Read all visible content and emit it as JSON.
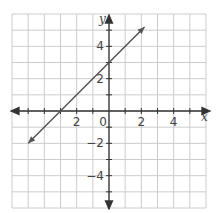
{
  "chart_data": {
    "type": "line",
    "title": "",
    "xlabel": "x",
    "ylabel": "y",
    "xlim": [
      -6,
      6
    ],
    "ylim": [
      -6,
      6
    ],
    "grid": true,
    "grid_step": 1,
    "x_tick_labels": [
      {
        "value": -2,
        "label": "2"
      },
      {
        "value": 0,
        "label": "0"
      },
      {
        "value": 2,
        "label": "2"
      },
      {
        "value": 4,
        "label": "4"
      }
    ],
    "y_tick_labels": [
      {
        "value": 4,
        "label": "4"
      },
      {
        "value": 2,
        "label": "2"
      },
      {
        "value": -2,
        "label": "−2"
      },
      {
        "value": -4,
        "label": "−4"
      }
    ],
    "series": [
      {
        "name": "y = x + 3",
        "equation": "y = x + 3",
        "slope": 1,
        "intercept": 3,
        "x": [
          -5,
          2.2
        ],
        "y": [
          -2,
          5.2
        ],
        "arrows": "both",
        "color": "#555555"
      }
    ],
    "colors": {
      "grid": "#cccccc",
      "axes": "#333333",
      "line": "#555555"
    }
  }
}
